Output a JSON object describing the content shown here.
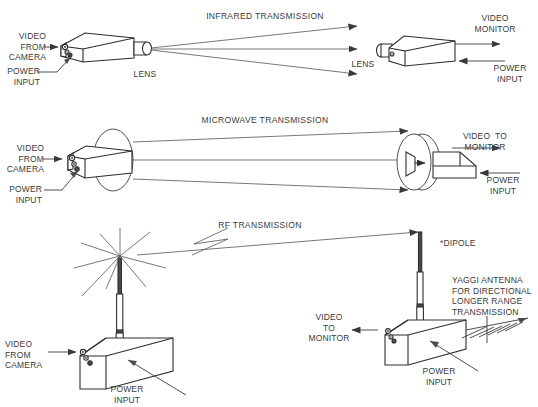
{
  "diagram": {
    "sections": [
      {
        "id": "infrared",
        "title": "INFRARED TRANSMISSION",
        "transmitter": {
          "video_label": "VIDEO\nFROM\nCAMERA",
          "power_label": "POWER\nINPUT",
          "optic_label": "LENS"
        },
        "receiver": {
          "device_label": "VIDEO\nMONITOR",
          "power_label": "POWER\nINPUT",
          "optic_label": "LENS"
        },
        "beam_count": 3
      },
      {
        "id": "microwave",
        "title": "MICROWAVE TRANSMISSION",
        "transmitter": {
          "video_label": "VIDEO\nFROM\nCAMERA",
          "power_label": "POWER\nINPUT",
          "antenna": "parabolic-dish"
        },
        "receiver": {
          "device_label": "VIDEO  TO\nMONITOR",
          "power_label": "POWER\nINPUT",
          "antenna": "parabolic-dish-with-feed-horn"
        },
        "beam_count": 3
      },
      {
        "id": "rf",
        "title": "RF TRANSMISSION",
        "transmitter": {
          "video_label": "VIDEO\nFROM\nCAMERA",
          "power_label": "POWER\nINPUT",
          "antenna": "telescoping-whip-antenna",
          "radiating_rays": 8
        },
        "receiver": {
          "device_label": "VIDEO\nTO\nMONITOR",
          "power_label": "POWER\nINPUT",
          "antenna": "telescoping-whip-antenna",
          "antenna_label": "*DIPOLE"
        },
        "note": "YAGGI ANTENNA\nFOR DIRECTIONAL\nLONGER RANGE\nTRANSMISSION",
        "note_antenna": "yaggi-antenna",
        "link_style": "lightning-bolt"
      }
    ],
    "colors": {
      "ink": "#3a3a3a",
      "ink_dark": "#2e2e2e",
      "background": "#ffffff",
      "connector": "#4a4a4a"
    }
  }
}
